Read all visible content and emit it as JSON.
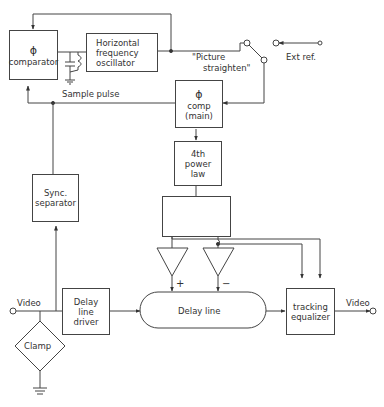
{
  "diagram": {
    "blocks": {
      "phase_comparator": {
        "symbol": "ϕ",
        "label": "comparator"
      },
      "h_osc": {
        "line1": "Horizontal",
        "line2": "frequency",
        "line3": "oscillator"
      },
      "phase_comp_main": {
        "symbol": "ϕ",
        "line1": "comp",
        "line2": "(main)"
      },
      "power_law": {
        "line1": "4th",
        "line2": "power",
        "line3": "law"
      },
      "sync_sep": {
        "line1": "Sync.",
        "line2": "separator"
      },
      "delay_driver": {
        "line1": "Delay",
        "line2": "line",
        "line3": "driver"
      },
      "delay_line": {
        "label": "Delay line"
      },
      "tracking_eq": {
        "line1": "tracking",
        "line2": "equalizer"
      },
      "clamp": {
        "label": "Clamp"
      }
    },
    "labels": {
      "sample_pulse": "Sample pulse",
      "picture_straighten_1": "\"Picture",
      "picture_straighten_2": "straighten\"",
      "ext_ref": "Ext ref.",
      "video_in": "Video",
      "video_out": "Video",
      "plus": "+",
      "minus": "−"
    }
  }
}
